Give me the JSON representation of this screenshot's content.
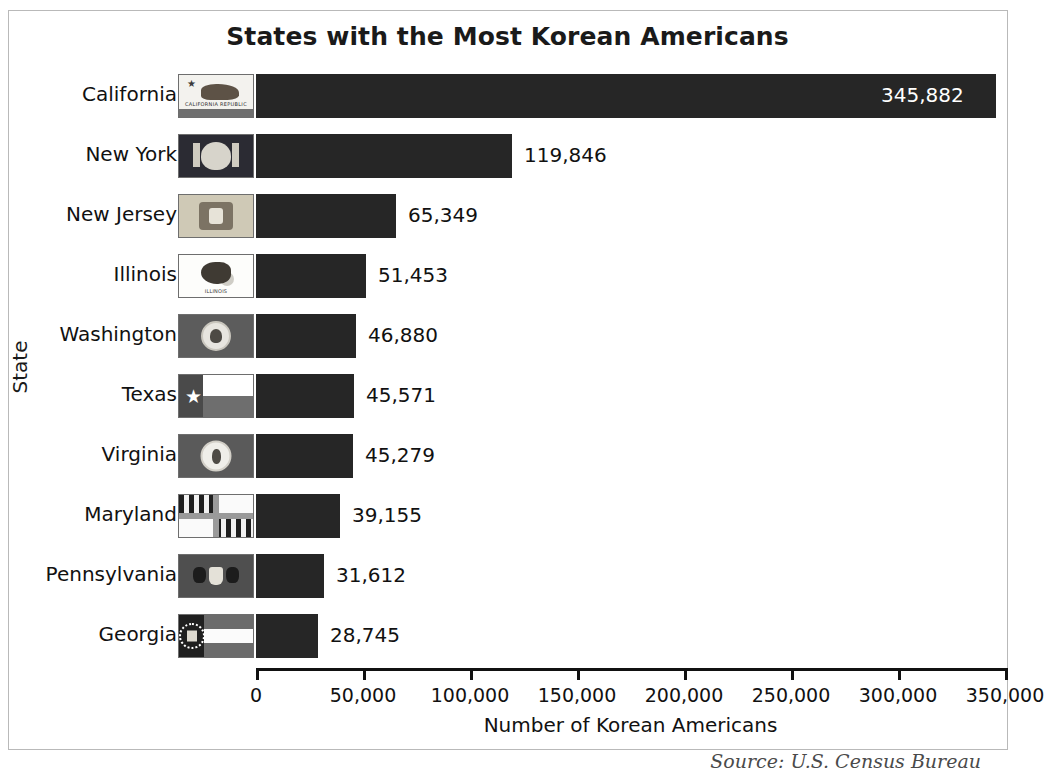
{
  "figure": {
    "title": "States with the Most Korean Americans",
    "source_note": "Source: U.S. Census Bureau"
  },
  "chart_data": {
    "type": "bar",
    "orientation": "horizontal",
    "title": "States with the Most Korean Americans",
    "xlabel": "Number of Korean Americans",
    "ylabel": "State",
    "xlim": [
      0,
      350000
    ],
    "grid": false,
    "legend": null,
    "xticks": [
      0,
      50000,
      100000,
      150000,
      200000,
      250000,
      300000,
      350000
    ],
    "xticklabels": [
      "0",
      "50,000",
      "100,000",
      "150,000",
      "200,000",
      "250,000",
      "300,000",
      "350,000"
    ],
    "categories": [
      "California",
      "New York",
      "New Jersey",
      "Illinois",
      "Washington",
      "Texas",
      "Virginia",
      "Maryland",
      "Pennsylvania",
      "Georgia"
    ],
    "values": [
      345882,
      119846,
      65349,
      51453,
      46880,
      45571,
      45279,
      39155,
      31612,
      28745
    ],
    "value_labels": [
      "345,882",
      "119,846",
      "65,349",
      "51,453",
      "46,880",
      "45,571",
      "45,279",
      "39,155",
      "31,612",
      "28,745"
    ],
    "bar_color": "#262626",
    "label_inside_bar": [
      true,
      false,
      false,
      false,
      false,
      false,
      false,
      false,
      false,
      false
    ]
  },
  "rows": [
    {
      "state": "California",
      "value_label": "345,882",
      "flag": "california-flag-icon",
      "inside": true
    },
    {
      "state": "New York",
      "value_label": "119,846",
      "flag": "new-york-flag-icon",
      "inside": false
    },
    {
      "state": "New Jersey",
      "value_label": "65,349",
      "flag": "new-jersey-flag-icon",
      "inside": false
    },
    {
      "state": "Illinois",
      "value_label": "51,453",
      "flag": "illinois-flag-icon",
      "inside": false
    },
    {
      "state": "Washington",
      "value_label": "46,880",
      "flag": "washington-flag-icon",
      "inside": false
    },
    {
      "state": "Texas",
      "value_label": "45,571",
      "flag": "texas-flag-icon",
      "inside": false
    },
    {
      "state": "Virginia",
      "value_label": "45,279",
      "flag": "virginia-flag-icon",
      "inside": false
    },
    {
      "state": "Maryland",
      "value_label": "39,155",
      "flag": "maryland-flag-icon",
      "inside": false
    },
    {
      "state": "Pennsylvania",
      "value_label": "31,612",
      "flag": "pennsylvania-flag-icon",
      "inside": false
    },
    {
      "state": "Georgia",
      "value_label": "28,745",
      "flag": "georgia-flag-icon",
      "inside": false
    }
  ],
  "flag_captions": {
    "california": "CALIFORNIA REPUBLIC",
    "illinois": "ILLINOIS"
  }
}
